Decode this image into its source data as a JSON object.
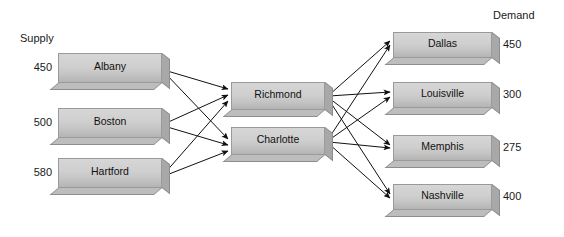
{
  "headers": {
    "supply": "Supply",
    "demand": "Demand"
  },
  "supply_nodes": [
    {
      "name": "Albany",
      "value": "450",
      "x": 58,
      "y": 53,
      "w": 104,
      "h": 30,
      "value_x": 18,
      "value_y": 61
    },
    {
      "name": "Boston",
      "value": "500",
      "x": 58,
      "y": 108,
      "w": 104,
      "h": 30,
      "value_x": 18,
      "value_y": 116
    },
    {
      "name": "Hartford",
      "value": "580",
      "x": 58,
      "y": 158,
      "w": 104,
      "h": 30,
      "value_x": 18,
      "value_y": 166
    }
  ],
  "hub_nodes": [
    {
      "name": "Richmond",
      "x": 231,
      "y": 82,
      "w": 94,
      "h": 28
    },
    {
      "name": "Charlotte",
      "x": 231,
      "y": 127,
      "w": 94,
      "h": 28
    }
  ],
  "demand_nodes": [
    {
      "name": "Dallas",
      "value": "450",
      "x": 393,
      "y": 32,
      "w": 99,
      "h": 26,
      "value_x": 503,
      "value_y": 38
    },
    {
      "name": "Louisville",
      "value": "300",
      "x": 393,
      "y": 82,
      "w": 99,
      "h": 26,
      "value_x": 503,
      "value_y": 88
    },
    {
      "name": "Memphis",
      "value": "275",
      "x": 393,
      "y": 135,
      "w": 99,
      "h": 26,
      "value_x": 503,
      "value_y": 141
    },
    {
      "name": "Nashville",
      "value": "400",
      "x": 393,
      "y": 184,
      "w": 99,
      "h": 26,
      "value_x": 503,
      "value_y": 190
    }
  ],
  "header_positions": {
    "supply": {
      "x": 20,
      "y": 32
    },
    "demand": {
      "x": 493,
      "y": 9
    }
  },
  "edges": [
    {
      "from": "Albany",
      "to": "Richmond",
      "x1": 164,
      "y1": 70,
      "x2": 228,
      "y2": 89
    },
    {
      "from": "Albany",
      "to": "Charlotte",
      "x1": 164,
      "y1": 72,
      "x2": 228,
      "y2": 139
    },
    {
      "from": "Boston",
      "to": "Richmond",
      "x1": 164,
      "y1": 124,
      "x2": 228,
      "y2": 95
    },
    {
      "from": "Boston",
      "to": "Charlotte",
      "x1": 164,
      "y1": 126,
      "x2": 228,
      "y2": 145
    },
    {
      "from": "Hartford",
      "to": "Richmond",
      "x1": 164,
      "y1": 174,
      "x2": 228,
      "y2": 101
    },
    {
      "from": "Hartford",
      "to": "Charlotte",
      "x1": 164,
      "y1": 176,
      "x2": 228,
      "y2": 151
    },
    {
      "from": "Richmond",
      "to": "Dallas",
      "x1": 329,
      "y1": 95,
      "x2": 390,
      "y2": 41
    },
    {
      "from": "Richmond",
      "to": "Louisville",
      "x1": 329,
      "y1": 96,
      "x2": 390,
      "y2": 92
    },
    {
      "from": "Richmond",
      "to": "Memphis",
      "x1": 329,
      "y1": 98,
      "x2": 390,
      "y2": 145
    },
    {
      "from": "Richmond",
      "to": "Nashville",
      "x1": 329,
      "y1": 100,
      "x2": 390,
      "y2": 194
    },
    {
      "from": "Charlotte",
      "to": "Dallas",
      "x1": 329,
      "y1": 138,
      "x2": 390,
      "y2": 45
    },
    {
      "from": "Charlotte",
      "to": "Louisville",
      "x1": 329,
      "y1": 140,
      "x2": 390,
      "y2": 97
    },
    {
      "from": "Charlotte",
      "to": "Memphis",
      "x1": 329,
      "y1": 142,
      "x2": 390,
      "y2": 148
    },
    {
      "from": "Charlotte",
      "to": "Nashville",
      "x1": 329,
      "y1": 144,
      "x2": 390,
      "y2": 198
    }
  ],
  "colors": {
    "arrow": "#111111",
    "node_face": "#cfcfcf",
    "node_border": "#9a9a9a",
    "background": "#ffffff",
    "text": "#111111"
  }
}
